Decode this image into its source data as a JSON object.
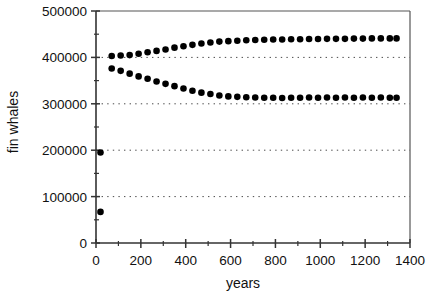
{
  "chart_data": {
    "type": "scatter",
    "title": "",
    "xlabel": "years",
    "ylabel": "fin whales",
    "xlim": [
      0,
      1400
    ],
    "ylim": [
      0,
      500000
    ],
    "xticks": [
      0,
      200,
      400,
      600,
      800,
      1000,
      1200,
      1400
    ],
    "xticklabels": [
      "0",
      "200",
      "400",
      "600",
      "800",
      "1000",
      "1200",
      "1400"
    ],
    "xminorticks": [
      100,
      300,
      500,
      700,
      900,
      1100,
      1300
    ],
    "yticks": [
      0,
      100000,
      200000,
      300000,
      400000,
      500000
    ],
    "yticklabels": [
      "0",
      "100000",
      "200000",
      "300000",
      "400000",
      "500000"
    ],
    "yminorticks": [
      50000,
      150000,
      250000,
      350000,
      450000
    ],
    "grid": "horizontal-dotted",
    "gridlines": [
      100000,
      200000,
      300000,
      400000
    ],
    "legend": "none",
    "marker": "filled-circle",
    "marker_color": "#000000",
    "series": [
      {
        "name": "upper-branch",
        "x": [
          20,
          70,
          110,
          150,
          190,
          230,
          270,
          310,
          350,
          390,
          430,
          470,
          510,
          550,
          590,
          630,
          670,
          710,
          750,
          790,
          830,
          870,
          910,
          950,
          990,
          1030,
          1070,
          1110,
          1150,
          1190,
          1230,
          1270,
          1310,
          1340
        ],
        "y": [
          195000,
          403000,
          404000,
          405000,
          408000,
          411000,
          414000,
          417000,
          421000,
          424000,
          427000,
          430000,
          432000,
          434000,
          435000,
          436000,
          437000,
          437500,
          438000,
          438500,
          438500,
          439000,
          439000,
          439500,
          439500,
          440000,
          440000,
          440000,
          440500,
          440500,
          441000,
          441000,
          441000,
          441000
        ]
      },
      {
        "name": "lower-branch",
        "x": [
          20,
          70,
          110,
          150,
          190,
          230,
          270,
          310,
          350,
          390,
          430,
          470,
          510,
          550,
          590,
          630,
          670,
          710,
          750,
          790,
          830,
          870,
          910,
          950,
          990,
          1030,
          1070,
          1110,
          1150,
          1190,
          1230,
          1270,
          1310,
          1340
        ],
        "y": [
          67000,
          376000,
          371000,
          365000,
          359000,
          354000,
          348000,
          343000,
          338000,
          333000,
          328000,
          324000,
          321000,
          318000,
          316000,
          315000,
          314000,
          313500,
          313000,
          313000,
          312500,
          313000,
          313000,
          313500,
          313000,
          313500,
          313000,
          313500,
          313000,
          313500,
          313000,
          313500,
          313000,
          313000
        ]
      }
    ]
  }
}
